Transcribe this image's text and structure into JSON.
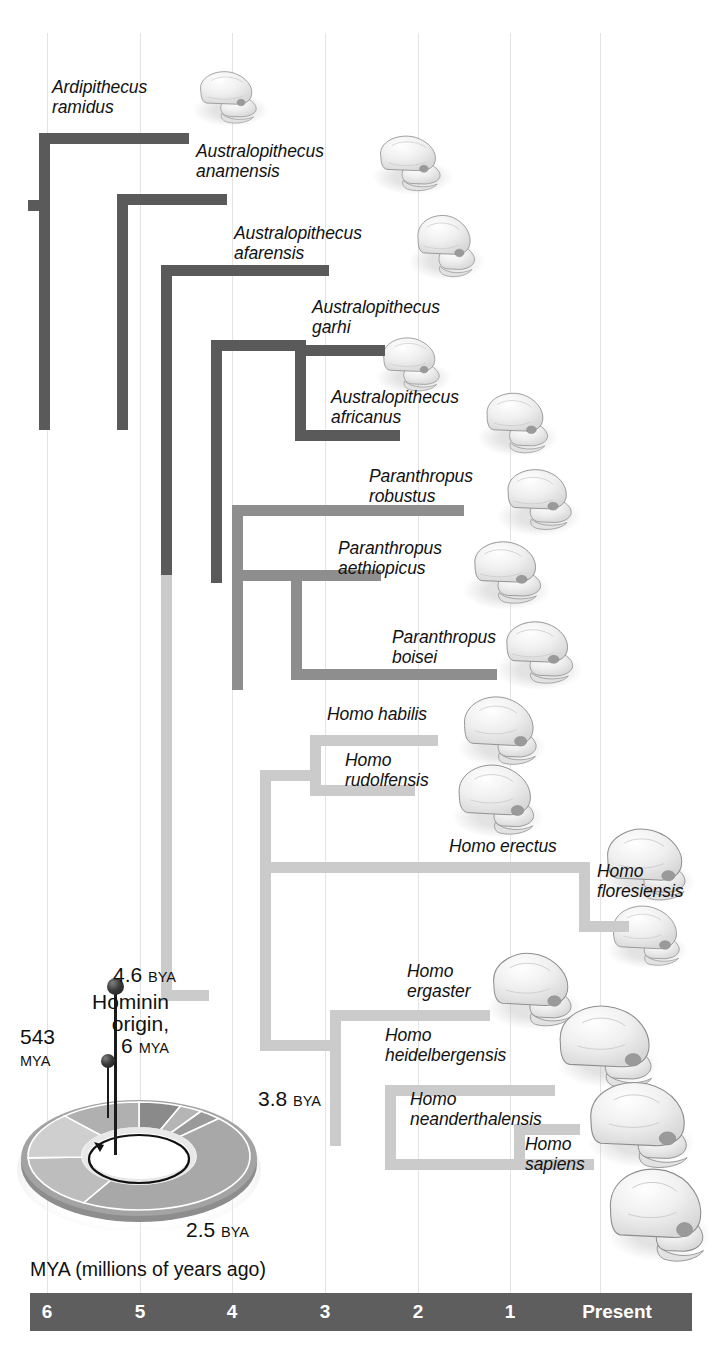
{
  "figure": {
    "type": "cladogram"
  },
  "axis": {
    "caption": "MYA (millions of years ago)",
    "ticks": [
      {
        "label": "6",
        "mya": 6,
        "x": 47
      },
      {
        "label": "5",
        "mya": 5,
        "x": 140
      },
      {
        "label": "4",
        "mya": 4,
        "x": 232
      },
      {
        "label": "3",
        "mya": 3,
        "x": 325
      },
      {
        "label": "2",
        "mya": 2,
        "x": 418
      },
      {
        "label": "1",
        "mya": 1,
        "x": 510
      },
      {
        "label": "Present",
        "mya": 0,
        "x": 617
      }
    ],
    "bar_color": "#5e5e5e",
    "tick_text_color": "#ffffff",
    "gridlines": true,
    "gridline_x": [
      47,
      140,
      232,
      325,
      418,
      510,
      600
    ]
  },
  "clades": {
    "ardipithecus_australopithecus": {
      "color": "#5a5a5a",
      "name": "Ardipithecus / Australopithecus"
    },
    "paranthropus": {
      "color": "#8e8e8e",
      "name": "Paranthropus"
    },
    "homo": {
      "color": "#cbcbcb",
      "name": "Homo"
    }
  },
  "taxa": [
    {
      "id": "ardipithecus-ramidus",
      "label": "Ardipithecus\nramidus",
      "clade": "ardipithecus_australopithecus",
      "tip_mya": 4.4
    },
    {
      "id": "australopithecus-anamensis",
      "label": "Australopithecus\nanamensis",
      "clade": "ardipithecus_australopithecus",
      "tip_mya": 3.9
    },
    {
      "id": "australopithecus-afarensis",
      "label": "Australopithecus\nafarensis",
      "clade": "ardipithecus_australopithecus",
      "tip_mya": 2.9
    },
    {
      "id": "australopithecus-garhi",
      "label": "Australopithecus\ngarhi",
      "clade": "ardipithecus_australopithecus",
      "tip_mya": 2.5
    },
    {
      "id": "australopithecus-africanus",
      "label": "Australopithecus\nafricanus",
      "clade": "ardipithecus_australopithecus",
      "tip_mya": 2.4
    },
    {
      "id": "paranthropus-robustus",
      "label": "Paranthropus\nrobustus",
      "clade": "paranthropus",
      "tip_mya": 1.5
    },
    {
      "id": "paranthropus-aethiopicus",
      "label": "Paranthropus\naethiopicus",
      "clade": "paranthropus",
      "tip_mya": 2.1
    },
    {
      "id": "paranthropus-boisei",
      "label": "Paranthropus\nboisei",
      "clade": "paranthropus",
      "tip_mya": 1.3
    },
    {
      "id": "homo-habilis",
      "label": "Homo habilis",
      "clade": "homo",
      "tip_mya": 1.6
    },
    {
      "id": "homo-rudolfensis",
      "label": "Homo\nrudolfensis",
      "clade": "homo",
      "tip_mya": 1.8
    },
    {
      "id": "homo-erectus",
      "label": "Homo erectus",
      "clade": "homo",
      "tip_mya": 0.4
    },
    {
      "id": "homo-floresiensis",
      "label": "Homo\nfloresiensis",
      "clade": "homo",
      "tip_mya": 0.1
    },
    {
      "id": "homo-ergaster",
      "label": "Homo\nergaster",
      "clade": "homo",
      "tip_mya": 1.0
    },
    {
      "id": "homo-heidelbergensis",
      "label": "Homo\nheidelbergensis",
      "clade": "homo",
      "tip_mya": 0.3
    },
    {
      "id": "homo-neanderthalensis",
      "label": "Homo\nneanderthalensis",
      "clade": "homo",
      "tip_mya": 0.05
    },
    {
      "id": "homo-sapiens",
      "label": "Homo\nsapiens",
      "clade": "homo",
      "tip_mya": 0.0
    }
  ],
  "clock": {
    "origin_label": "Hominin\norigin,",
    "origin_value": "6",
    "origin_unit": "MYA",
    "earth_value": "4.6",
    "earth_unit": "BYA",
    "life_value": "3.8",
    "life_unit": "BYA",
    "oxygen_value": "2.5",
    "oxygen_unit": "BYA",
    "cambrian_value": "543",
    "cambrian_unit": "MYA"
  }
}
